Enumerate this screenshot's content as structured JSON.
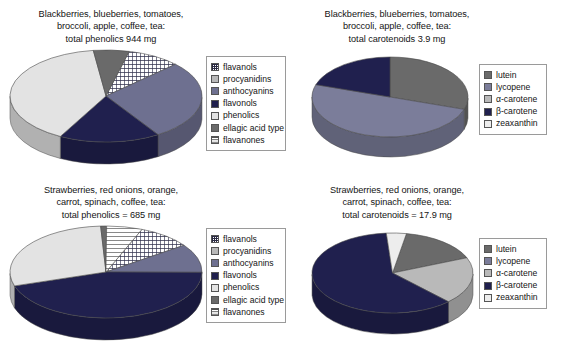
{
  "figure": {
    "background": "#ffffff",
    "width": 570,
    "height": 351
  },
  "palette": {
    "flavanols": "#ffffff",
    "procyanidins": "#b9b9b9",
    "anthocyanins": "#6e7090",
    "flavonols": "#20204e",
    "phenolics": "#e3e3e3",
    "ellagic_acid_type": "#6a6a6a",
    "flavanones": "#ffffff",
    "lutein": "#6a6a6a",
    "lycopene": "#7b7d9a",
    "alpha_carotene": "#b9b9b9",
    "beta_carotene": "#20204e",
    "zeaxanthin": "#ededed"
  },
  "panels": {
    "top_left": {
      "title_lines": [
        "Blackberries, blueberries, tomatoes,",
        "broccoli, apple, coffee, tea:",
        "total phenolics 944 mg"
      ],
      "legend": [
        {
          "label": "flavanols",
          "swatch": "checker"
        },
        {
          "label": "procyanidins",
          "swatch": "procyanidins"
        },
        {
          "label": "anthocyanins",
          "swatch": "anthocyanins"
        },
        {
          "label": "flavonols",
          "swatch": "flavonols"
        },
        {
          "label": "phenolics",
          "swatch": "phenolics"
        },
        {
          "label": "ellagic acid type",
          "swatch": "ellagic"
        },
        {
          "label": "flavanones",
          "swatch": "hlines"
        }
      ]
    },
    "top_right": {
      "title_lines": [
        "Blackberries, blueberries, tomatoes,",
        "broccoli, apple, coffee, tea:",
        "total carotenoids 3.9 mg"
      ],
      "legend": [
        {
          "label": "lutein",
          "swatch": "lutein"
        },
        {
          "label": "lycopene",
          "swatch": "lycopene"
        },
        {
          "label": "α-carotene",
          "swatch": "alpha"
        },
        {
          "label": "β-carotene",
          "swatch": "beta"
        },
        {
          "label": "zeaxanthin",
          "swatch": "zea"
        }
      ]
    },
    "bottom_left": {
      "title_lines": [
        "Strawberries, red onions, orange,",
        "carrot, spinach, coffee, tea:",
        "total phenolics = 685 mg"
      ],
      "legend": [
        {
          "label": "flavanols",
          "swatch": "checker"
        },
        {
          "label": "procyanidins",
          "swatch": "procyanidins"
        },
        {
          "label": "anthocyanins",
          "swatch": "anthocyanins"
        },
        {
          "label": "flavonols",
          "swatch": "flavonols"
        },
        {
          "label": "phenolics",
          "swatch": "phenolics"
        },
        {
          "label": "ellagic acid type",
          "swatch": "ellagic"
        },
        {
          "label": "flavanones",
          "swatch": "hlines"
        }
      ]
    },
    "bottom_right": {
      "title_lines": [
        "Strawberries, red onions, orange,",
        "carrot, spinach, coffee, tea:",
        "total carotenoids = 17.9 mg"
      ],
      "legend": [
        {
          "label": "lutein",
          "swatch": "lutein"
        },
        {
          "label": "lycopene",
          "swatch": "lycopene"
        },
        {
          "label": "α-carotene",
          "swatch": "alpha"
        },
        {
          "label": "β-carotene",
          "swatch": "beta"
        },
        {
          "label": "zeaxanthin",
          "swatch": "zea"
        }
      ]
    }
  },
  "chart_data": [
    {
      "id": "top_left",
      "type": "pie",
      "title": "Blackberries, blueberries, tomatoes, broccoli, apple, coffee, tea: total phenolics 944 mg",
      "total_label": "total phenolics 944 mg",
      "total_value": 944,
      "units": "mg",
      "three_d": true,
      "legend_position": "right",
      "labels": [
        "flavanols",
        "procyanidins",
        "anthocyanins",
        "flavonols",
        "phenolics",
        "ellagic acid type",
        "flavanones"
      ],
      "values": [
        9,
        0,
        28,
        17,
        40,
        6,
        0
      ],
      "fills": [
        "checker",
        "procyanidins",
        "anthocyanins",
        "flavonols",
        "phenolics",
        "ellagic",
        "hlines"
      ]
    },
    {
      "id": "top_right",
      "type": "pie",
      "title": "Blackberries, blueberries, tomatoes, broccoli, apple, coffee, tea: total carotenoids 3.9 mg",
      "total_label": "total carotenoids 3.9 mg",
      "total_value": 3.9,
      "units": "mg",
      "three_d": true,
      "legend_position": "right",
      "labels": [
        "lutein",
        "lycopene",
        "α-carotene",
        "β-carotene",
        "zeaxanthin"
      ],
      "values": [
        30,
        50,
        0,
        20,
        0
      ],
      "fills": [
        "lutein",
        "lycopene",
        "alpha",
        "beta",
        "zea"
      ]
    },
    {
      "id": "bottom_left",
      "type": "pie",
      "title": "Strawberries, red onions, orange, carrot, spinach, coffee, tea: total phenolics = 685 mg",
      "total_label": "total phenolics = 685 mg",
      "total_value": 685,
      "units": "mg",
      "three_d": true,
      "legend_position": "right",
      "labels": [
        "flavanols",
        "procyanidins",
        "anthocyanins",
        "flavonols",
        "phenolics",
        "ellagic acid type",
        "flavanones"
      ],
      "values": [
        9,
        0,
        10,
        45,
        29,
        1,
        6
      ],
      "fills": [
        "checker",
        "procyanidins",
        "anthocyanins",
        "flavonols",
        "phenolics",
        "ellagic",
        "hlines"
      ]
    },
    {
      "id": "bottom_right",
      "type": "pie",
      "title": "Strawberries, red onions, orange, carrot, spinach, coffee, tea: total carotenoids = 17.9 mg",
      "total_label": "total carotenoids = 17.9 mg",
      "total_value": 17.9,
      "units": "mg",
      "three_d": true,
      "legend_position": "right",
      "labels": [
        "lutein",
        "lycopene",
        "α-carotene",
        "β-carotene",
        "zeaxanthin"
      ],
      "values": [
        16,
        0,
        19,
        61,
        4
      ],
      "fills": [
        "lutein",
        "lycopene",
        "alpha",
        "beta",
        "zea"
      ]
    }
  ]
}
